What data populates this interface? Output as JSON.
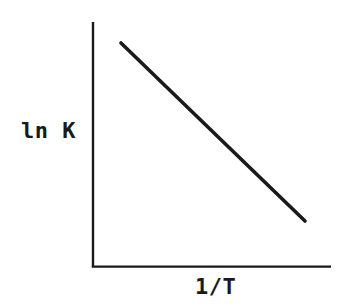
{
  "figure": {
    "title": "",
    "background_color": "#ffffff",
    "ink_color": "#1a1a1a",
    "width": 344,
    "height": 307
  },
  "axes": {
    "y_label": "ln K",
    "x_label": "1/T",
    "y_axis_name": "y-axis-line",
    "x_axis_name": "x-axis-line",
    "origin": {
      "x": 93,
      "y": 267
    },
    "y_top": 22,
    "x_right": 331,
    "axis_stroke_width": 2.4,
    "ticks": [],
    "tick_labels": [],
    "grid": false
  },
  "chart_data": {
    "type": "line",
    "title": "",
    "subtitle": "",
    "xlabel": "1/T",
    "ylabel": "ln K",
    "grid": false,
    "legend": null,
    "legend_position": "none",
    "axis_tick_labels_shown": false,
    "series": [
      {
        "name": "van 't Hoff line",
        "style": "solid",
        "color": "#1a1a1a",
        "stroke_width": 3.6,
        "x": [
          0.152,
          1.0
        ],
        "y": [
          1.0,
          0.188
        ],
        "pixel_points": [
          {
            "x": 121,
            "y": 43
          },
          {
            "x": 305,
            "y": 221
          }
        ],
        "slope_sign": "negative",
        "description": "straight line with negative slope"
      }
    ],
    "xlim": [
      0,
      1
    ],
    "ylim": [
      0,
      1
    ],
    "annotations": []
  }
}
